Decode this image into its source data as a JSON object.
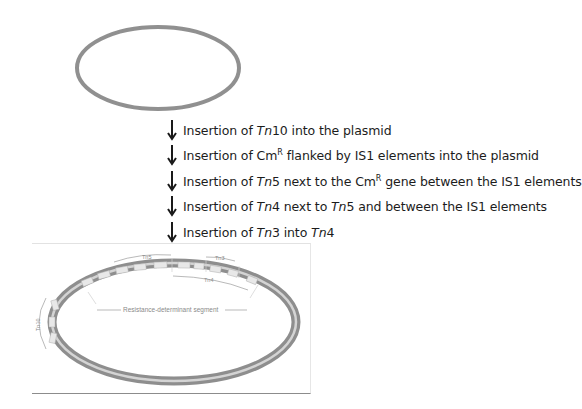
{
  "diagram": {
    "initial_plasmid": {
      "label": "",
      "stroke_color": "#8a8a8a"
    },
    "steps": [
      {
        "prefix": "Insertion of ",
        "parts": [
          {
            "t": "Tn",
            "i": true
          },
          {
            "t": "10 into the plasmid"
          }
        ]
      },
      {
        "prefix": "Insertion of ",
        "parts": [
          {
            "t": "Cm"
          },
          {
            "t": "R",
            "sup": true
          },
          {
            "t": " flanked by IS1 elements into the plasmid"
          }
        ]
      },
      {
        "prefix": "Insertion of  ",
        "parts": [
          {
            "t": "Tn",
            "i": true
          },
          {
            "t": "5 next to the Cm"
          },
          {
            "t": "R",
            "sup": true
          },
          {
            "t": " gene between the IS1 elements"
          }
        ]
      },
      {
        "prefix": "Insertion of  ",
        "parts": [
          {
            "t": "Tn",
            "i": true
          },
          {
            "t": "4 next to "
          },
          {
            "t": "Tn",
            "i": true
          },
          {
            "t": "5 and between the IS1 elements"
          }
        ]
      },
      {
        "prefix": "Insertion of  ",
        "parts": [
          {
            "t": "Tn",
            "i": true
          },
          {
            "t": "3 into "
          },
          {
            "t": "Tn",
            "i": true
          },
          {
            "t": "4"
          }
        ]
      }
    ],
    "final_plasmid": {
      "labels": {
        "tn5": "Tn5",
        "tn3": "Tn3",
        "tn4": "Tn4",
        "tn10": "Tn10",
        "segment": "Resistance-determinant segment"
      },
      "tube_color": "#9a9a9a",
      "tube_highlight": "#d6d6d6"
    },
    "arrow_color": "#1a1a1a"
  }
}
